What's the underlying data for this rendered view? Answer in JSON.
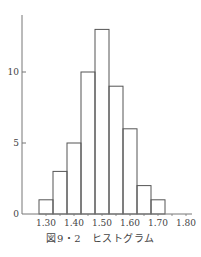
{
  "chart_data": {
    "type": "bar",
    "title": "図9・2　ヒストグラム",
    "xlabel": "",
    "ylabel": "",
    "categories": [
      "1.30",
      "1.35",
      "1.40",
      "1.45",
      "1.50",
      "1.55",
      "1.60",
      "1.65",
      "1.70"
    ],
    "values": [
      1,
      3,
      5,
      10,
      13,
      9,
      6,
      2,
      1
    ],
    "bin_width": 0.05,
    "x_tick_labels": [
      "1.30",
      "1.40",
      "1.50",
      "1.60",
      "1.70",
      "1.80"
    ],
    "y_tick_labels": [
      "0",
      "5",
      "10"
    ],
    "ylim": [
      0,
      14
    ],
    "xlim": [
      1.25,
      1.82
    ],
    "grid": false,
    "legend": null
  },
  "caption": "図9・2　ヒストグラム"
}
